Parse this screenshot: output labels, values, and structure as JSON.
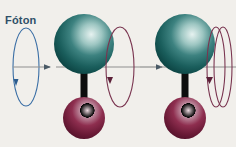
{
  "figure": {
    "type": "diagram",
    "background_color": "#f1efeb",
    "width": 236,
    "height": 147
  },
  "labels": {
    "photon": "Fóton"
  },
  "colors": {
    "photon_label_text": "#2e4f68",
    "photon_spin_ellipse": "#3a6ea5",
    "molecule_spin_ellipse": "#7a3550",
    "axis_line": "#8a8a8a",
    "bond": "#0d0d0d",
    "top_atom_dark": "#12504f",
    "top_atom_mid": "#2d7776",
    "top_atom_light": "#cfe3e0",
    "bottom_atom_dark": "#5f1630",
    "bottom_atom_mid": "#8e2a4c",
    "bottom_atom_light": "#dfc5cf"
  },
  "elements": {
    "photon_spin": {
      "name": "photon-circular-polarization",
      "shape": "narrow vertical ellipse with downward arrowhead",
      "color": "#3a6ea5",
      "cx": 26,
      "cy": 67,
      "rx": 13,
      "ry": 39,
      "loops": 1
    },
    "photon_arrow": {
      "name": "photon-propagation-arrow",
      "direction": "right",
      "x1": 13,
      "x2": 56,
      "y": 67
    },
    "transition_arrow": {
      "name": "transition-arrow",
      "direction": "right",
      "x1": 136,
      "x2": 160,
      "y": 67
    },
    "molecules": [
      {
        "id": "molecule-before",
        "state": "slow rotation",
        "top_atom": {
          "cx": 84,
          "cy": 44,
          "r": 30
        },
        "bottom_atom": {
          "cx": 84,
          "cy": 118,
          "r": 21
        },
        "bond": {
          "x": 84,
          "y1": 62,
          "y2": 118,
          "width": 7
        },
        "spin": {
          "cx": 120,
          "cy": 67,
          "rx": 14,
          "ry": 40,
          "loops": 1,
          "color": "#7a3550"
        },
        "axis": {
          "x1": 56,
          "x2": 140,
          "y": 67
        }
      },
      {
        "id": "molecule-after",
        "state": "fast rotation",
        "top_atom": {
          "cx": 185,
          "cy": 44,
          "r": 30
        },
        "bottom_atom": {
          "cx": 185,
          "cy": 118,
          "r": 21
        },
        "bond": {
          "x": 185,
          "y1": 62,
          "y2": 118,
          "width": 7
        },
        "spin": {
          "cx": 219,
          "cy": 67,
          "rx": 9,
          "ry": 40,
          "loops": 2,
          "color": "#7a3550"
        },
        "axis": {
          "x1": 160,
          "x2": 236,
          "y": 67
        }
      }
    ]
  }
}
